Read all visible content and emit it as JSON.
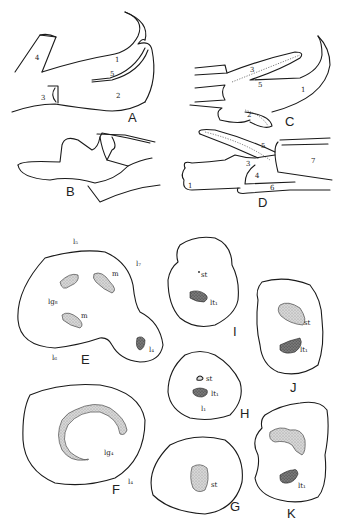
{
  "figure": {
    "panels": [
      {
        "id": "A",
        "labels": [
          "1",
          "2",
          "3",
          "4",
          "5"
        ]
      },
      {
        "id": "B",
        "labels": []
      },
      {
        "id": "C",
        "labels": [
          "1",
          "2",
          "3",
          "5"
        ]
      },
      {
        "id": "D",
        "labels": [
          "1",
          "3",
          "4",
          "5",
          "6",
          "7"
        ]
      },
      {
        "id": "E",
        "labels": [
          "l5",
          "l7",
          "m",
          "m",
          "lg8",
          "l6",
          "l4"
        ]
      },
      {
        "id": "F",
        "labels": [
          "lg4",
          "l4"
        ]
      },
      {
        "id": "G",
        "labels": [
          "st"
        ]
      },
      {
        "id": "H",
        "labels": [
          "st",
          "lt1",
          "l1"
        ]
      },
      {
        "id": "I",
        "labels": [
          "st",
          "lt1"
        ]
      },
      {
        "id": "J",
        "labels": [
          "st",
          "lt1"
        ]
      },
      {
        "id": "K",
        "labels": [
          "lt1"
        ]
      }
    ],
    "text": {
      "A": "A",
      "B": "B",
      "C": "C",
      "D": "D",
      "E": "E",
      "F": "F",
      "G": "G",
      "H": "H",
      "I": "I",
      "J": "J",
      "K": "K",
      "n1": "1",
      "n2": "2",
      "n3": "3",
      "n4": "4",
      "n5": "5",
      "n6": "6",
      "n7": "7",
      "l5": "l₅",
      "l7": "l₇",
      "l6": "l₆",
      "l4": "l₄",
      "l1": "l₁",
      "m": "m",
      "lg8": "lg₈",
      "lg4": "lg₄",
      "st": "st",
      "lt1": "lt₁"
    }
  }
}
